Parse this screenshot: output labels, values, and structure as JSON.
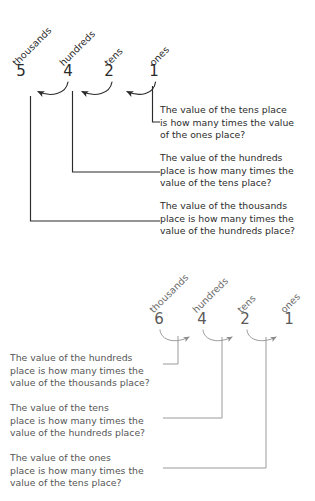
{
  "figure": {
    "background_color": "#ffffff",
    "ink_color": "#2b2b2b",
    "light_ink_color": "#7a7a7a"
  },
  "top_diagram": {
    "name": "place-value-diagram-left-arrows",
    "number": "5421",
    "arrow_direction": "left",
    "places": [
      {
        "label": "thousands",
        "digit": "5"
      },
      {
        "label": "hundreds",
        "digit": "4"
      },
      {
        "label": "tens",
        "digit": "2"
      },
      {
        "label": "ones",
        "digit": "1"
      }
    ],
    "questions": [
      "The value of the tens place\nis how many times the value\nof the ones place?",
      "The value of the hundreds\nplace is how many times the\nvalue of the tens place?",
      "The value of the thousands\nplace is how many times the\nvalue of the hundreds place?"
    ]
  },
  "bottom_diagram": {
    "name": "place-value-diagram-right-arrows",
    "number": "6421",
    "arrow_direction": "right",
    "places": [
      {
        "label": "thousands",
        "digit": "6"
      },
      {
        "label": "hundreds",
        "digit": "4"
      },
      {
        "label": "tens",
        "digit": "2"
      },
      {
        "label": "ones",
        "digit": "1"
      }
    ],
    "questions": [
      "The value of the hundreds\nplace is how many times the\nvalue of the thousands place?",
      "The value of the tens\nplace is how many times the\nvalue of the hundreds place?",
      "The value of the ones\nplace is how many times the\nvalue of the tens place?"
    ]
  }
}
